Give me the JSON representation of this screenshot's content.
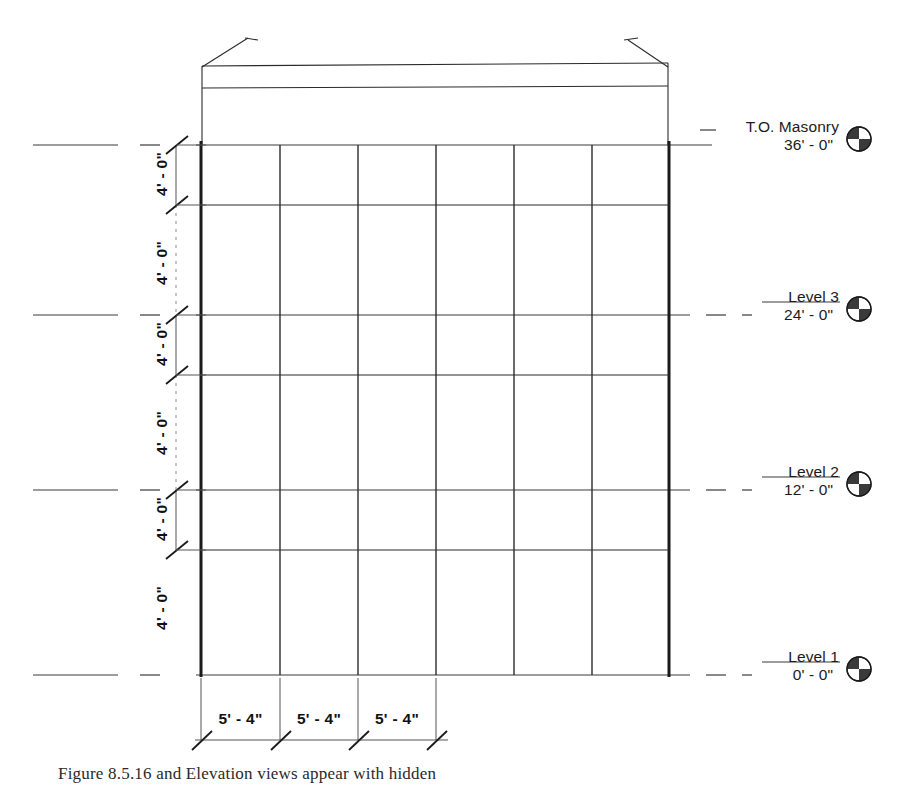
{
  "drawing": {
    "title": "Building elevation with level datums and dimensions",
    "line_color": "#2b2b2b",
    "wall_color": "#1a1a1a",
    "datum_color": "#3a3a3a"
  },
  "levels": [
    {
      "name": "T.O. Masonry",
      "elevation": "36' - 0\"",
      "symbol": "level-datum-icon"
    },
    {
      "name": "Level 3",
      "elevation": "24' - 0\"",
      "symbol": "level-datum-icon"
    },
    {
      "name": "Level 2",
      "elevation": "12' - 0\"",
      "symbol": "level-datum-icon"
    },
    {
      "name": "Level 1",
      "elevation": "0' - 0\"",
      "symbol": "level-datum-icon"
    }
  ],
  "vertical_dimensions": [
    {
      "value": "4' - 0\""
    },
    {
      "value": "4' - 0\""
    },
    {
      "value": "4' - 0\""
    },
    {
      "value": "4' - 0\""
    },
    {
      "value": "4' - 0\""
    },
    {
      "value": "4' - 0\""
    }
  ],
  "horizontal_dimensions": [
    {
      "value": "5' - 4\""
    },
    {
      "value": "5' - 4\""
    },
    {
      "value": "5' - 4\""
    }
  ],
  "caption": {
    "figure": "Figure 8.5.16",
    "text": "and Elevation views appear with hidden"
  }
}
